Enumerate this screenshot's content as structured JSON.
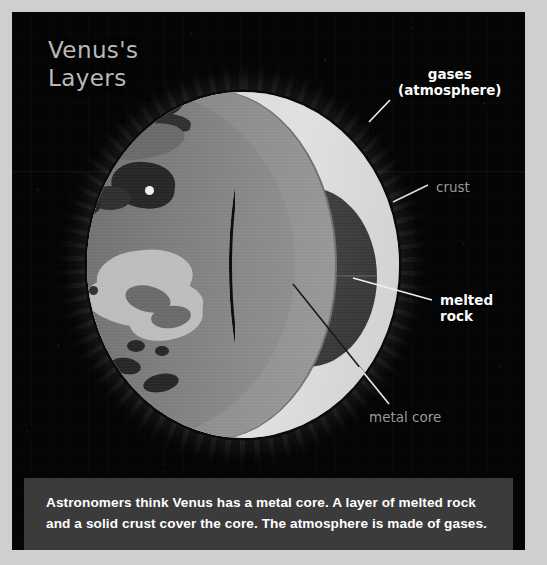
{
  "figure": {
    "title": "Venus's\nLayers",
    "caption": "Astronomers think Venus has a metal core. A layer of melted rock and a solid crust cover the core. The atmosphere is made of gases."
  },
  "labels": {
    "gases": "gases\n(atmosphere)",
    "crust": "crust",
    "melted_rock": "melted\nrock",
    "metal_core": "metal core"
  },
  "colors": {
    "background": "#050505",
    "frame": "#cfcfcf",
    "crust_surface": "#7c7c7c",
    "cut_face": "#8e8e8e",
    "melted_rock": "#dadada",
    "metal_core": "#3b3b3b",
    "caption_background": "#3b3b3b",
    "label_white": "#fafafa",
    "label_gray": "#9a9a9a",
    "title": "#b9b9b9"
  },
  "diagram": {
    "type": "cutaway-cross-section",
    "subject": "Venus",
    "layers": [
      "gases (atmosphere)",
      "crust",
      "melted rock",
      "metal core"
    ]
  }
}
